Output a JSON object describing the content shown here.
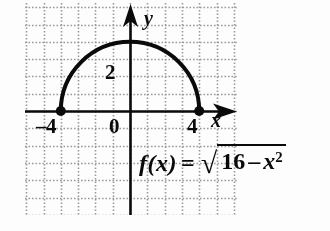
{
  "figure": {
    "background_color": "#fdfdfd",
    "ink_color": "#0a0a0a",
    "grid_color": "#9a9a9a"
  },
  "axes": {
    "x_axis_label": "x",
    "y_axis_label": "y",
    "origin_label": "0",
    "x_tick_left_label": "–4",
    "x_tick_right_label": "4",
    "y_tick_label": "2"
  },
  "equation": {
    "function_name": "f(x)",
    "equals": "=",
    "radical_sign": "√",
    "radicand_number": "16",
    "radicand_minus": "–",
    "radicand_variable": "x",
    "radicand_exponent": "2",
    "full_text": "f(x) = √(16 – x²)"
  },
  "chart_data": {
    "type": "line",
    "title": "",
    "subtitle": "",
    "xlabel": "x",
    "ylabel": "y",
    "xlim": [
      -6.2,
      6.3
    ],
    "ylim": [
      -6.1,
      6.3
    ],
    "xticks": [
      -4,
      0,
      4
    ],
    "xticklabels": [
      "–4",
      "0",
      "4"
    ],
    "yticks": [
      2
    ],
    "yticklabels": [
      "2"
    ],
    "grid": true,
    "grid_style": "dotted",
    "grid_spacing": 1,
    "legend": false,
    "annotations": [
      {
        "text": "f(x) = √(16 – x²)",
        "x": 1.2,
        "y": -2.3
      }
    ],
    "series": [
      {
        "name": "f(x) = sqrt(16 - x^2)",
        "type": "semicircle",
        "domain": [
          -4,
          4
        ],
        "range": [
          0,
          4
        ],
        "radius": 4,
        "center": [
          0,
          0
        ],
        "color": "#0a0a0a",
        "linewidth": 4,
        "x": [
          -4,
          -3.5,
          -3,
          -2.5,
          -2,
          -1.5,
          -1,
          -0.5,
          0,
          0.5,
          1,
          1.5,
          2,
          2.5,
          3,
          3.5,
          4
        ],
        "values": [
          0,
          1.94,
          2.65,
          3.12,
          3.46,
          3.71,
          3.87,
          3.97,
          4,
          3.97,
          3.87,
          3.71,
          3.46,
          3.12,
          2.65,
          1.94,
          0
        ]
      }
    ],
    "endpoints": [
      {
        "label": "left-endpoint",
        "x": -4,
        "y": 0,
        "marker": "filled-circle"
      },
      {
        "label": "right-endpoint",
        "x": 4,
        "y": 0,
        "marker": "filled-circle"
      }
    ]
  }
}
